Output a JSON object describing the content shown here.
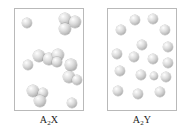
{
  "figure": {
    "background_color": "#ffffff",
    "panel_border_color": "#b9b9b9",
    "sphere_color": "#c3c3c3",
    "sphere_highlight_color": "#ffffff"
  },
  "panels": [
    {
      "id": "panel-left",
      "caption_formula": "A",
      "caption_subscript": "2",
      "caption_element": "X",
      "caption_text": "A2X",
      "box": {
        "x": 14,
        "y": 8,
        "width": 70,
        "height": 103
      },
      "particle_count": 16,
      "arrangement": "clustered",
      "spheres": [
        {
          "cx": 12,
          "cy": 14,
          "r": 5.0
        },
        {
          "cx": 50,
          "cy": 10,
          "r": 6.0
        },
        {
          "cx": 60,
          "cy": 13,
          "r": 6.2
        },
        {
          "cx": 50,
          "cy": 20,
          "r": 6.0
        },
        {
          "cx": 24,
          "cy": 47,
          "r": 6.3
        },
        {
          "cx": 34,
          "cy": 50,
          "r": 5.6
        },
        {
          "cx": 43,
          "cy": 46,
          "r": 6.0
        },
        {
          "cx": 13,
          "cy": 56,
          "r": 4.9
        },
        {
          "cx": 56,
          "cy": 56,
          "r": 5.6
        },
        {
          "cx": 54,
          "cy": 68,
          "r": 6.2
        },
        {
          "cx": 62,
          "cy": 71,
          "r": 5.2
        },
        {
          "cx": 18,
          "cy": 82,
          "r": 6.0
        },
        {
          "cx": 28,
          "cy": 84,
          "r": 5.2
        },
        {
          "cx": 25,
          "cy": 92,
          "r": 6.0
        },
        {
          "cx": 57,
          "cy": 94,
          "r": 5.2
        },
        {
          "cx": 42,
          "cy": 53,
          "r": 4.6
        }
      ]
    },
    {
      "id": "panel-right",
      "caption_formula": "A",
      "caption_subscript": "2",
      "caption_element": "Y",
      "caption_text": "A2Y",
      "box": {
        "x": 107,
        "y": 8,
        "width": 70,
        "height": 103
      },
      "particle_count": 17,
      "arrangement": "dispersed",
      "spheres": [
        {
          "cx": 27,
          "cy": 11,
          "r": 5.0
        },
        {
          "cx": 45,
          "cy": 10,
          "r": 5.2
        },
        {
          "cx": 13,
          "cy": 21,
          "r": 5.2
        },
        {
          "cx": 57,
          "cy": 21,
          "r": 5.2
        },
        {
          "cx": 34,
          "cy": 36,
          "r": 5.3
        },
        {
          "cx": 60,
          "cy": 38,
          "r": 5.0
        },
        {
          "cx": 9,
          "cy": 45,
          "r": 5.2
        },
        {
          "cx": 26,
          "cy": 48,
          "r": 5.3
        },
        {
          "cx": 45,
          "cy": 50,
          "r": 5.0
        },
        {
          "cx": 60,
          "cy": 54,
          "r": 5.0
        },
        {
          "cx": 12,
          "cy": 62,
          "r": 5.2
        },
        {
          "cx": 33,
          "cy": 66,
          "r": 5.2
        },
        {
          "cx": 58,
          "cy": 68,
          "r": 5.0
        },
        {
          "cx": 10,
          "cy": 82,
          "r": 5.2
        },
        {
          "cx": 30,
          "cy": 85,
          "r": 5.2
        },
        {
          "cx": 52,
          "cy": 83,
          "r": 5.0
        },
        {
          "cx": 46,
          "cy": 67,
          "r": 4.4
        }
      ]
    }
  ]
}
